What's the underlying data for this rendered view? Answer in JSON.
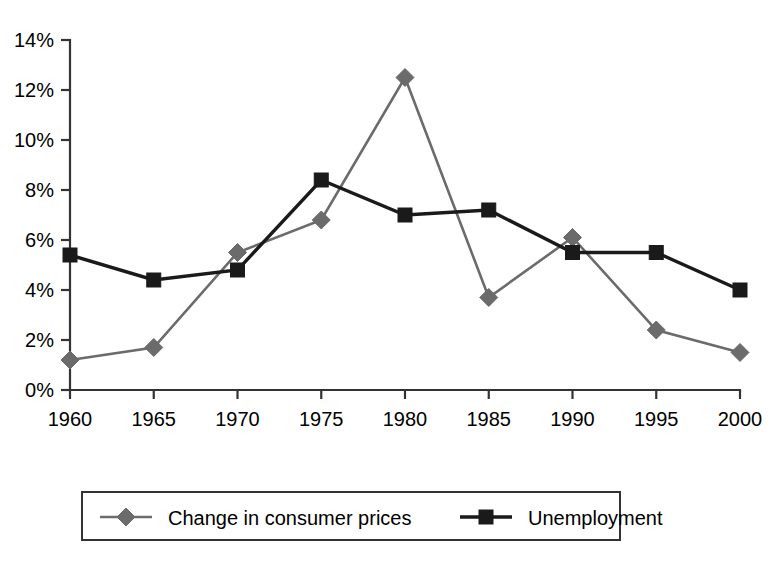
{
  "chart_data": {
    "type": "line",
    "title": "",
    "subtitle": "",
    "xlabel": "",
    "ylabel": "",
    "categories": [
      1960,
      1965,
      1970,
      1975,
      1980,
      1985,
      1990,
      1995,
      2000
    ],
    "x_tick_labels": [
      "1960",
      "1965",
      "1970",
      "1975",
      "1980",
      "1985",
      "1990",
      "1995",
      "2000"
    ],
    "y_tick_labels": [
      "0%",
      "2%",
      "4%",
      "6%",
      "8%",
      "10%",
      "12%",
      "14%"
    ],
    "y_tick_values": [
      0,
      2,
      4,
      6,
      8,
      10,
      12,
      14
    ],
    "ylim": [
      0,
      14
    ],
    "xlim": [
      1960,
      2000
    ],
    "grid": false,
    "legend_position": "bottom",
    "series": [
      {
        "name": "Change in consumer prices",
        "color": "#6b6b6b",
        "marker": "diamond",
        "values": [
          1.2,
          1.7,
          5.5,
          6.8,
          12.5,
          3.7,
          6.1,
          2.4,
          1.5
        ]
      },
      {
        "name": "Unemployment",
        "color": "#1a1a1a",
        "marker": "square",
        "values": [
          5.4,
          4.4,
          4.8,
          8.4,
          7.0,
          7.2,
          5.5,
          5.5,
          4.0
        ]
      }
    ]
  },
  "legend": {
    "items": [
      {
        "label": "Change in consumer prices",
        "marker": "diamond-marker",
        "color": "#6b6b6b"
      },
      {
        "label": "Unemployment",
        "marker": "square-marker",
        "color": "#1a1a1a"
      }
    ]
  },
  "colors": {
    "background": "#ffffff",
    "axis": "#333333",
    "prices_series": "#6b6b6b",
    "unemployment_series": "#1a1a1a",
    "text": "#000000"
  }
}
